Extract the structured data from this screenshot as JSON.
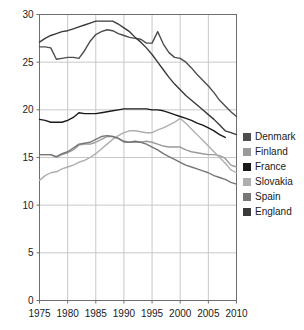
{
  "chart_data": {
    "type": "line",
    "title": "",
    "xlabel": "",
    "ylabel": "",
    "xlim": [
      1975,
      2010
    ],
    "ylim": [
      0,
      30
    ],
    "ytick_values": [
      0,
      5,
      10,
      15,
      20,
      25,
      30
    ],
    "ytick_labels": [
      "0",
      "5",
      "10",
      "15",
      "20",
      "25",
      "30"
    ],
    "xtick_values": [
      1975,
      1980,
      1985,
      1990,
      1995,
      2000,
      2005,
      2010
    ],
    "xtick_labels": [
      "1975",
      "1980",
      "1985",
      "1990",
      "1995",
      "2000",
      "2005",
      "2010"
    ],
    "grid": true,
    "legend_position": "right",
    "series": [
      {
        "name": "Denmark",
        "color": "#4d4d4d",
        "x": [
          1975,
          1976,
          1977,
          1978,
          1979,
          1980,
          1981,
          1982,
          1983,
          1984,
          1985,
          1986,
          1987,
          1988,
          1989,
          1990,
          1991,
          1992,
          1993,
          1994,
          1995,
          1996,
          1997,
          1998,
          1999,
          2000,
          2001,
          2002,
          2003,
          2004,
          2005,
          2006,
          2007,
          2008,
          2009,
          2010
        ],
        "y": [
          26.6,
          26.6,
          26.5,
          25.3,
          25.4,
          25.5,
          25.5,
          25.4,
          26.2,
          27.2,
          27.9,
          28.2,
          28.4,
          28.3,
          28.0,
          27.8,
          27.6,
          27.5,
          27.4,
          27.0,
          27.0,
          28.2,
          26.9,
          26.0,
          25.5,
          25.4,
          25.0,
          24.4,
          23.7,
          23.1,
          22.5,
          21.8,
          21.0,
          20.4,
          19.8,
          19.3
        ]
      },
      {
        "name": "Finland",
        "color": "#9a9a9a",
        "x": [
          1975,
          1976,
          1977,
          1978,
          1979,
          1980,
          1981,
          1982,
          1983,
          1984,
          1985,
          1986,
          1987,
          1988,
          1989,
          1990,
          1991,
          1992,
          1993,
          1994,
          1995,
          1996,
          1997,
          1998,
          1999,
          2000,
          2001,
          2002,
          2003,
          2004,
          2005,
          2006,
          2007,
          2008,
          2009,
          2010
        ],
        "y": [
          15.3,
          15.3,
          15.3,
          15.0,
          15.3,
          15.5,
          15.8,
          16.3,
          16.4,
          16.4,
          16.6,
          16.9,
          17.2,
          17.2,
          17.0,
          16.6,
          16.6,
          16.6,
          16.6,
          16.7,
          16.6,
          16.4,
          16.2,
          16.1,
          16.1,
          16.1,
          15.8,
          15.6,
          15.5,
          15.4,
          15.3,
          15.3,
          15.2,
          14.9,
          14.2,
          14.0
        ]
      },
      {
        "name": "France",
        "color": "#1a1a1a",
        "x": [
          1975,
          1976,
          1977,
          1978,
          1979,
          1980,
          1981,
          1982,
          1983,
          1984,
          1985,
          1986,
          1987,
          1988,
          1989,
          1990,
          1991,
          1992,
          1993,
          1994,
          1995,
          1996,
          1997,
          1998,
          1999,
          2000,
          2001,
          2002,
          2003,
          2004,
          2005,
          2006,
          2007,
          2008
        ],
        "y": [
          19.0,
          18.9,
          18.7,
          18.7,
          18.7,
          18.9,
          19.2,
          19.7,
          19.6,
          19.6,
          19.6,
          19.7,
          19.8,
          19.9,
          20.0,
          20.1,
          20.1,
          20.1,
          20.1,
          20.1,
          20.0,
          20.0,
          19.9,
          19.7,
          19.5,
          19.3,
          19.1,
          18.9,
          18.6,
          18.4,
          18.1,
          17.8,
          17.4,
          17.1
        ]
      },
      {
        "name": "Slovakia",
        "color": "#aeaeae",
        "x": [
          1975,
          1976,
          1977,
          1978,
          1979,
          1980,
          1981,
          1982,
          1983,
          1984,
          1985,
          1986,
          1987,
          1988,
          1989,
          1990,
          1991,
          1992,
          1993,
          1994,
          1995,
          1996,
          1997,
          1998,
          1999,
          2000,
          2001,
          2002,
          2003,
          2004,
          2005,
          2006,
          2007,
          2008,
          2009,
          2010
        ],
        "y": [
          12.6,
          13.1,
          13.4,
          13.5,
          13.8,
          14.0,
          14.2,
          14.5,
          14.7,
          15.0,
          15.4,
          15.9,
          16.4,
          16.9,
          17.3,
          17.6,
          17.8,
          17.8,
          17.7,
          17.6,
          17.6,
          17.9,
          18.1,
          18.4,
          18.7,
          19.1,
          18.6,
          18.0,
          17.4,
          16.8,
          16.2,
          15.6,
          15.0,
          14.4,
          13.7,
          13.4
        ]
      },
      {
        "name": "Spain",
        "color": "#767676",
        "x": [
          1975,
          1976,
          1977,
          1978,
          1979,
          1980,
          1981,
          1982,
          1983,
          1984,
          1985,
          1986,
          1987,
          1988,
          1989,
          1990,
          1991,
          1992,
          1993,
          1994,
          1995,
          1996,
          1997,
          1998,
          1999,
          2000,
          2001,
          2002,
          2003,
          2004,
          2005,
          2006,
          2007,
          2008,
          2009,
          2010
        ],
        "y": [
          15.3,
          15.3,
          15.3,
          15.1,
          15.4,
          15.6,
          16.0,
          16.4,
          16.5,
          16.6,
          16.9,
          17.2,
          17.3,
          17.2,
          17.0,
          16.7,
          16.6,
          16.7,
          16.6,
          16.4,
          16.1,
          15.8,
          15.4,
          15.1,
          14.8,
          14.5,
          14.2,
          14.0,
          13.8,
          13.6,
          13.4,
          13.1,
          12.9,
          12.7,
          12.4,
          12.2
        ]
      },
      {
        "name": "England",
        "color": "#3a3a3a",
        "x": [
          1975,
          1976,
          1977,
          1978,
          1979,
          1980,
          1981,
          1982,
          1983,
          1984,
          1985,
          1986,
          1987,
          1988,
          1989,
          1990,
          1991,
          1992,
          1993,
          1994,
          1995,
          1996,
          1997,
          1998,
          1999,
          2000,
          2001,
          2002,
          2003,
          2004,
          2005,
          2006,
          2007,
          2008,
          2009,
          2010
        ],
        "y": [
          27.1,
          27.5,
          27.8,
          28.0,
          28.2,
          28.3,
          28.5,
          28.7,
          28.9,
          29.1,
          29.3,
          29.3,
          29.3,
          29.3,
          29.0,
          28.6,
          28.2,
          27.6,
          27.1,
          26.5,
          25.8,
          25.0,
          24.2,
          23.4,
          22.7,
          22.1,
          21.5,
          21.0,
          20.5,
          20.0,
          19.5,
          19.0,
          18.4,
          17.8,
          17.6,
          17.4
        ]
      }
    ]
  },
  "legend": {
    "items": [
      {
        "label": "Denmark",
        "color": "#4d4d4d"
      },
      {
        "label": "Finland",
        "color": "#9a9a9a"
      },
      {
        "label": "France",
        "color": "#1a1a1a"
      },
      {
        "label": "Slovakia",
        "color": "#aeaeae"
      },
      {
        "label": "Spain",
        "color": "#767676"
      },
      {
        "label": "England",
        "color": "#3a3a3a"
      }
    ]
  },
  "axes": {
    "grid_color": "#c8c8c8",
    "frame_color": "#6e6e6e",
    "tick_color": "#6e6e6e",
    "text_color": "#1a1a1a"
  }
}
